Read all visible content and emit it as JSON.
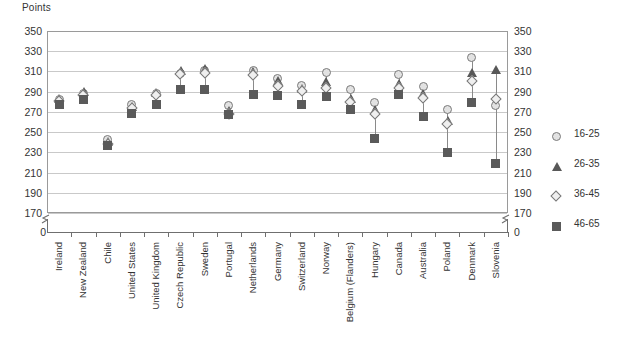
{
  "chart_data": {
    "type": "scatter",
    "title": "",
    "subtitle": "",
    "ylabel": "Points",
    "xlabel": "",
    "ylim": [
      170,
      350
    ],
    "ytick_step": 20,
    "yticks": [
      350,
      330,
      310,
      290,
      270,
      250,
      230,
      210,
      190,
      170
    ],
    "axis_break_label": "0",
    "grid": true,
    "legend_position": "right",
    "axis_break": true,
    "categories": [
      "Ireland",
      "New Zealand",
      "Chile",
      "United States",
      "United Kingdom",
      "Czech Republic",
      "Sweden",
      "Portugal",
      "Netherlands",
      "Germany",
      "Switzerland",
      "Norway",
      "Belgium (Flanders)",
      "Hungary",
      "Canada",
      "Australia",
      "Poland",
      "Denmark",
      "Slovenia"
    ],
    "series": [
      {
        "name": "16-25",
        "marker": "circle",
        "color": "#e2e2e2",
        "values": [
          282,
          288,
          243,
          277,
          288,
          308,
          311,
          276,
          311,
          303,
          296,
          309,
          292,
          279,
          307,
          295,
          272,
          324,
          276
        ]
      },
      {
        "name": "26-35",
        "marker": "triangle",
        "color": "#585858",
        "values": [
          283,
          290,
          240,
          275,
          289,
          311,
          313,
          271,
          310,
          301,
          293,
          300,
          283,
          272,
          298,
          288,
          261,
          309,
          312
        ]
      },
      {
        "name": "36-45",
        "marker": "diamond",
        "color": "#efefef",
        "values": [
          281,
          287,
          238,
          274,
          287,
          307,
          308,
          268,
          306,
          296,
          291,
          294,
          280,
          268,
          294,
          284,
          258,
          301,
          283
        ]
      },
      {
        "name": "46-65",
        "marker": "square",
        "color": "#5a5a5a",
        "values": [
          277,
          282,
          237,
          268,
          277,
          292,
          292,
          267,
          287,
          286,
          277,
          285,
          272,
          244,
          287,
          265,
          230,
          279,
          219
        ]
      }
    ],
    "note_display_order": [
      "16-25",
      "26-35",
      "36-45",
      "46-65"
    ]
  },
  "legend": {
    "items": [
      {
        "label": "16-25",
        "icon": "circle-marker-icon"
      },
      {
        "label": "26-35",
        "icon": "triangle-marker-icon"
      },
      {
        "label": "36-45",
        "icon": "diamond-marker-icon"
      },
      {
        "label": "46-65",
        "icon": "square-marker-icon"
      }
    ]
  }
}
